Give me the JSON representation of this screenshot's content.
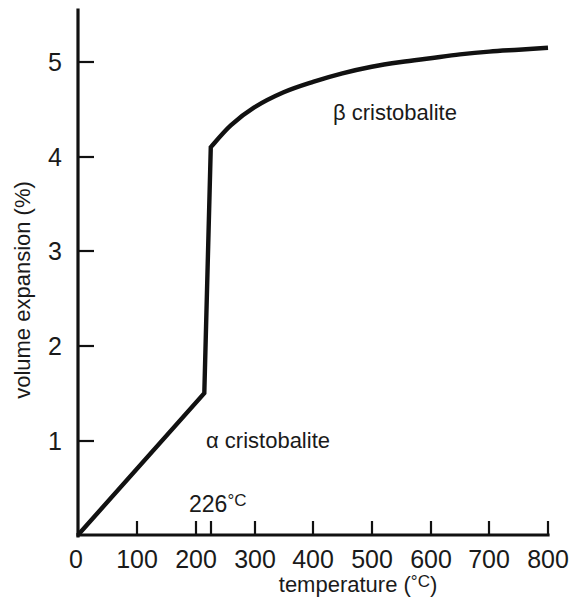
{
  "chart_data": {
    "type": "line",
    "title": "",
    "xlabel": "temperature (°C)",
    "ylabel": "volume expansion (%)",
    "xlim": [
      0,
      800
    ],
    "ylim": [
      0,
      5.55
    ],
    "grid": false,
    "legend_position": "inline-annotations",
    "x_ticks": [
      0,
      100,
      200,
      300,
      400,
      500,
      600,
      700,
      800
    ],
    "x_tick_labels": [
      "0",
      "100",
      "200",
      "300",
      "400",
      "500",
      "600",
      "700",
      "800"
    ],
    "extra_x_ticks": [
      226
    ],
    "y_ticks": [
      0,
      1,
      2,
      3,
      4,
      5
    ],
    "y_tick_labels": [
      "0",
      "1",
      "2",
      "3",
      "4",
      "5"
    ],
    "line_color": "#111111",
    "series": [
      {
        "name": "α cristobalite",
        "points": [
          [
            0,
            0.0
          ],
          [
            215,
            1.5
          ]
        ]
      },
      {
        "name": "transition",
        "points": [
          [
            215,
            1.5
          ],
          [
            226,
            4.1
          ]
        ]
      },
      {
        "name": "β cristobalite",
        "points": [
          [
            226,
            4.1
          ],
          [
            260,
            4.33
          ],
          [
            300,
            4.52
          ],
          [
            350,
            4.68
          ],
          [
            400,
            4.79
          ],
          [
            450,
            4.88
          ],
          [
            500,
            4.95
          ],
          [
            550,
            5.0
          ],
          [
            600,
            5.04
          ],
          [
            650,
            5.08
          ],
          [
            700,
            5.11
          ],
          [
            750,
            5.13
          ],
          [
            800,
            5.15
          ]
        ]
      }
    ],
    "annotations": [
      {
        "text": "α cristobalite",
        "x": 226,
        "y": 1.02
      },
      {
        "text": "β cristobalite",
        "x": 440,
        "y": 4.45
      },
      {
        "text": "226°C",
        "x": 226,
        "y": 0.43
      }
    ]
  },
  "labels": {
    "alpha_series": "α cristobalite",
    "beta_series": "β cristobalite",
    "transition_temp": "226",
    "degree_c": "°C",
    "x_axis_title_main": "temperature (",
    "x_axis_title_unit": "°C",
    "x_axis_title_close": ")",
    "y_axis_title": "volume expansion (%)",
    "x0": "0",
    "x100": "100",
    "x200": "200",
    "x300": "300",
    "x400": "400",
    "x500": "500",
    "x600": "600",
    "x700": "700",
    "x800": "800",
    "y0": "0",
    "y1": "1",
    "y2": "2",
    "y3": "3",
    "y4": "4",
    "y5": "5"
  }
}
